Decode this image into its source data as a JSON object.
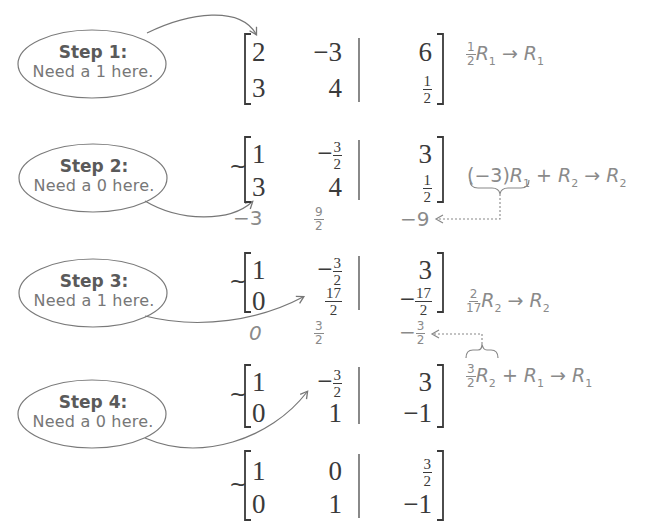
{
  "steps": [
    {
      "title": "Step 1:",
      "body": "Need a 1 here."
    },
    {
      "title": "Step 2:",
      "body": "Need a 0 here."
    },
    {
      "title": "Step 3:",
      "body": "Need a 1 here."
    },
    {
      "title": "Step 4:",
      "body": "Need a 0 here."
    }
  ],
  "matrices": [
    {
      "prefix": "",
      "rows": [
        [
          "2",
          "−3",
          "6"
        ],
        [
          "3",
          "4",
          "1/2"
        ]
      ]
    },
    {
      "prefix": "~",
      "rows": [
        [
          "1",
          "−3/2",
          "3"
        ],
        [
          "3",
          "4",
          "1/2"
        ]
      ]
    },
    {
      "prefix": "~",
      "rows": [
        [
          "1",
          "−3/2",
          "3"
        ],
        [
          "0",
          "17/2",
          "−17/2"
        ]
      ]
    },
    {
      "prefix": "~",
      "rows": [
        [
          "1",
          "−3/2",
          "3"
        ],
        [
          "0",
          "1",
          "−1"
        ]
      ]
    },
    {
      "prefix": "~",
      "rows": [
        [
          "1",
          "0",
          "3/2"
        ],
        [
          "0",
          "1",
          "−1"
        ]
      ]
    }
  ],
  "helper_rows": [
    {
      "values": [
        "−3",
        "9/2",
        "−9"
      ]
    },
    {
      "values": [
        "0",
        "3/2",
        "−3/2"
      ]
    }
  ],
  "operations": [
    {
      "text": "½R₁ → R₁",
      "coef": {
        "num": "1",
        "den": "2"
      },
      "row": "R",
      "row_sub": "1",
      "target": "R",
      "target_sub": "1"
    },
    {
      "text": "(−3)R₁ + R₂ → R₂",
      "coef": "(−3)",
      "row": "R",
      "row_sub": "1",
      "plus_row": "R",
      "plus_sub": "2",
      "target": "R",
      "target_sub": "2"
    },
    {
      "text": "(2/17)R₂ → R₂",
      "coef": {
        "num": "2",
        "den": "17"
      },
      "row": "R",
      "row_sub": "2",
      "target": "R",
      "target_sub": "2"
    },
    {
      "text": "(3/2)R₂ + R₁ → R₁",
      "coef": {
        "num": "3",
        "den": "2"
      },
      "row": "R",
      "row_sub": "2",
      "plus_row": "R",
      "plus_sub": "1",
      "target": "R",
      "target_sub": "1"
    }
  ],
  "symbols": {
    "arrow": "→",
    "plus": "+",
    "minus": "−",
    "tilde": "~"
  },
  "colors": {
    "ink": "#3a3a3a",
    "annotation": "#8a8a8a",
    "bubble_stroke": "#7a7a7a"
  }
}
